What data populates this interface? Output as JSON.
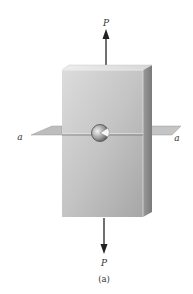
{
  "figure": {
    "caption": "(a)",
    "top_force_label": "P",
    "bottom_force_label": "P",
    "plane_label_left": "a",
    "plane_label_right": "a"
  },
  "colors": {
    "background": "#ffffff",
    "block_front_light": "#d6d6d6",
    "block_front_dark": "#a9a9a9",
    "block_top": "#e6e6e6",
    "block_side": "#8f8f8f",
    "plane": "#b8b8b8",
    "arrow": "#222222",
    "text": "#333333"
  }
}
